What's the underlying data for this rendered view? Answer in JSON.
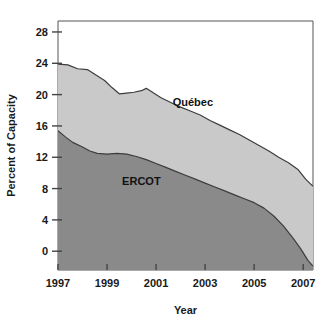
{
  "chart_data": {
    "type": "area",
    "stacked": false,
    "title": "",
    "xlabel": "Year",
    "ylabel": "Percent of Capacity",
    "xlim": [
      1997,
      2007.4
    ],
    "ylim": [
      -2.4,
      29.4
    ],
    "xticks": [
      1997,
      1999,
      2001,
      2003,
      2005,
      2007
    ],
    "xtick_labels": [
      "1997",
      "1999",
      "2001",
      "2003",
      "2005",
      "2007"
    ],
    "yticks": [
      0,
      4,
      8,
      12,
      16,
      20,
      24,
      28
    ],
    "ytick_labels": [
      "0",
      "4",
      "8",
      "12",
      "16",
      "20",
      "24",
      "28"
    ],
    "grid": false,
    "legend_position": "inline-annotations",
    "series": [
      {
        "name": "Québec",
        "color": "#c9c9c9",
        "outline_color": "#3d3d3d",
        "label_x": 2002.5,
        "label_y": 18.6,
        "x": [
          1997.0,
          1997.4,
          1997.8,
          1998.2,
          1998.5,
          1998.9,
          1999.2,
          1999.5,
          1999.8,
          2000.1,
          2000.4,
          2000.6,
          2000.9,
          2001.2,
          2001.6,
          2002.0,
          2002.4,
          2002.8,
          2003.2,
          2003.6,
          2004.0,
          2004.4,
          2004.8,
          2005.2,
          2005.6,
          2006.0,
          2006.4,
          2006.8,
          2007.1,
          2007.4
        ],
        "values": [
          23.9,
          23.8,
          23.3,
          23.2,
          22.6,
          21.8,
          20.9,
          20.1,
          20.2,
          20.3,
          20.5,
          20.8,
          20.2,
          19.6,
          19.0,
          18.4,
          17.9,
          17.4,
          16.7,
          16.1,
          15.5,
          14.9,
          14.2,
          13.5,
          12.8,
          12.0,
          11.3,
          10.4,
          9.2,
          8.3
        ]
      },
      {
        "name": "ERCOT",
        "color": "#8a8a8a",
        "outline_color": "#3d3d3d",
        "label_x": 2000.4,
        "label_y": 8.4,
        "x": [
          1997.0,
          1997.3,
          1997.6,
          1998.0,
          1998.3,
          1998.6,
          1999.0,
          1999.4,
          1999.8,
          2000.2,
          2000.6,
          2001.0,
          2001.4,
          2001.8,
          2002.2,
          2002.6,
          2003.0,
          2003.4,
          2003.8,
          2004.2,
          2004.6,
          2005.0,
          2005.4,
          2005.8,
          2006.2,
          2006.6,
          2006.9,
          2007.2,
          2007.4
        ],
        "values": [
          15.4,
          14.6,
          13.9,
          13.3,
          12.8,
          12.5,
          12.4,
          12.5,
          12.4,
          12.1,
          11.7,
          11.2,
          10.7,
          10.2,
          9.7,
          9.2,
          8.7,
          8.2,
          7.7,
          7.2,
          6.7,
          6.2,
          5.5,
          4.5,
          3.2,
          1.6,
          0.3,
          -1.2,
          -1.9
        ]
      }
    ]
  }
}
